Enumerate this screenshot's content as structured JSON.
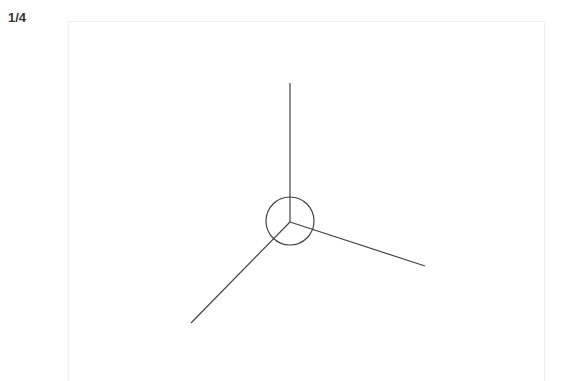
{
  "page_indicator": "1/4",
  "diagram": {
    "stroke_color": "#444444",
    "center": {
      "x": 290,
      "y": 222
    },
    "circle_radius": 24,
    "lines": [
      {
        "name": "vertical-up-line",
        "x2": 290,
        "y2": 83
      },
      {
        "name": "lower-left-line",
        "x2": 191,
        "y2": 323
      },
      {
        "name": "right-line",
        "x2": 425,
        "y2": 266
      }
    ]
  }
}
